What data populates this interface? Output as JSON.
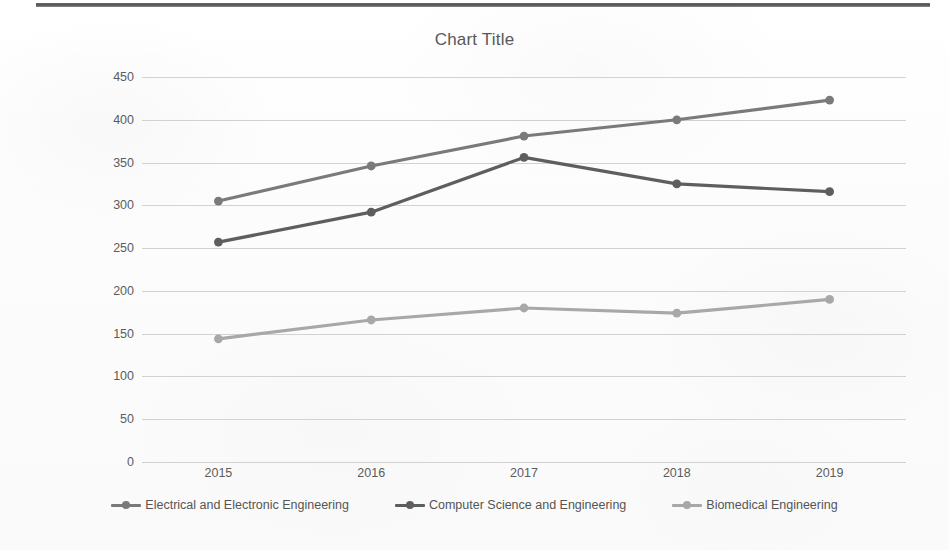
{
  "document": {
    "top_rule": true
  },
  "chart_data": {
    "type": "line",
    "title": "Chart Title",
    "xlabel": "",
    "ylabel": "",
    "categories": [
      "2015",
      "2016",
      "2017",
      "2018",
      "2019"
    ],
    "ylim": [
      0,
      450
    ],
    "yticks": [
      0,
      50,
      100,
      150,
      200,
      250,
      300,
      350,
      400,
      450
    ],
    "ytick_labels": [
      "0",
      "50",
      "100",
      "150",
      "200",
      "250",
      "300",
      "350",
      "400",
      "450"
    ],
    "grid": true,
    "legend_position": "bottom",
    "series": [
      {
        "name": "Electrical and Electronic Engineering",
        "color": "#7a7a7a",
        "values": [
          305,
          346,
          381,
          400,
          423
        ]
      },
      {
        "name": "Computer Science and Engineering",
        "color": "#5e5e5e",
        "values": [
          257,
          292,
          356,
          325,
          316
        ]
      },
      {
        "name": "Biomedical Engineering",
        "color": "#a8a8a8",
        "values": [
          144,
          166,
          180,
          174,
          190
        ]
      }
    ]
  }
}
